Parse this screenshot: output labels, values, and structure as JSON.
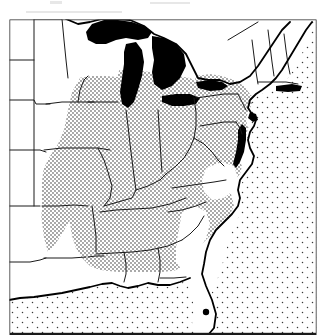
{
  "figure": {
    "kind": "distribution-range-map",
    "region_title": "Eastern United States",
    "caption": "",
    "width_px": 329,
    "height_px": 335
  },
  "style": {
    "background_color": "#ffffff",
    "ink_color": "#000000",
    "frame_color": "#1a1a1a",
    "water_fill_color": "#000000",
    "land_fill_color": "#ffffff",
    "range_stipple_color": "#2b2b2b",
    "ocean_stipple_color": "#3a3a3a",
    "frame_stroke_width": 2.2,
    "coast_stroke_width": 1.7,
    "state_stroke_width": 1.0,
    "range_stipple_spacing_px": 4,
    "range_stipple_dot_px": 1.5,
    "ocean_stipple_spacing_px": 10,
    "ocean_stipple_dot_px": 1.4
  },
  "frame": {
    "x": 8,
    "y": 18,
    "width": 310,
    "height": 317
  },
  "legend_items": [
    {
      "key": "range",
      "label": "",
      "pattern": "dense-stipple"
    },
    {
      "key": "outside-range",
      "label": "",
      "pattern": "white"
    },
    {
      "key": "water",
      "label": "",
      "pattern": "solid-black"
    },
    {
      "key": "ocean",
      "label": "",
      "pattern": "sparse-stipple"
    }
  ],
  "water_features": [
    {
      "name": "lake-superior"
    },
    {
      "name": "lake-michigan"
    },
    {
      "name": "lake-huron"
    },
    {
      "name": "lake-erie"
    },
    {
      "name": "lake-ontario"
    },
    {
      "name": "chesapeake-bay"
    },
    {
      "name": "delaware-bay"
    },
    {
      "name": "long-island-sound"
    },
    {
      "name": "lake-okeechobee"
    }
  ],
  "shaded_regions": [
    {
      "name": "upper-midwest-range"
    },
    {
      "name": "ohio-valley-range"
    },
    {
      "name": "mid-atlantic-range"
    },
    {
      "name": "southeast-range"
    },
    {
      "name": "ozark-range"
    }
  ],
  "unshaded_regions": [
    {
      "name": "northern-plains"
    },
    {
      "name": "texas-oklahoma"
    },
    {
      "name": "new-england"
    },
    {
      "name": "maine"
    },
    {
      "name": "florida"
    },
    {
      "name": "gulf-coastal-plain"
    },
    {
      "name": "northern-wisconsin-michigan"
    }
  ],
  "scan_artifacts": [
    {
      "x": 50,
      "y": 1,
      "w": 12,
      "h": 3
    },
    {
      "x": 26,
      "y": 11,
      "w": 96,
      "h": 2
    },
    {
      "x": 150,
      "y": 2,
      "w": 40,
      "h": 2
    }
  ]
}
